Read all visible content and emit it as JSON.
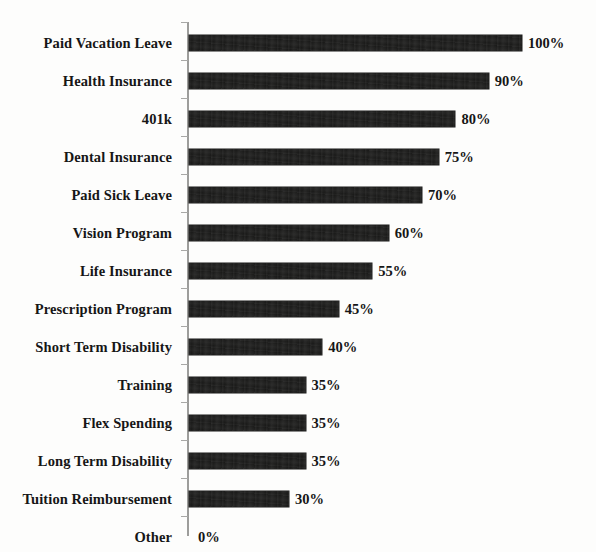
{
  "chart_data": {
    "type": "bar",
    "orientation": "horizontal",
    "title": "",
    "subtitle": "",
    "xlabel": "",
    "ylabel": "",
    "xlim": [
      0,
      100
    ],
    "grid": false,
    "legend": null,
    "value_suffix": "%",
    "categories": [
      "Paid Vacation Leave",
      "Health Insurance",
      "401k",
      "Dental Insurance",
      "Paid Sick Leave",
      "Vision Program",
      "Life Insurance",
      "Prescription Program",
      "Short Term Disability",
      "Training",
      "Flex Spending",
      "Long Term Disability",
      "Tuition Reimbursement",
      "Other"
    ],
    "values": [
      100,
      90,
      80,
      75,
      70,
      60,
      55,
      45,
      40,
      35,
      35,
      35,
      30,
      0
    ],
    "data_labels": [
      "100%",
      "90%",
      "80%",
      "75%",
      "70%",
      "60%",
      "55%",
      "45%",
      "40%",
      "35%",
      "35%",
      "35%",
      "30%",
      "0%"
    ],
    "bar_color": "#1a1a19",
    "axis_color": "#9d9d9b",
    "background_color": "#fdfdfc"
  },
  "rows": [
    {
      "label": "Paid Vacation Leave",
      "value": 100,
      "value_label": "100%"
    },
    {
      "label": "Health Insurance",
      "value": 90,
      "value_label": "90%"
    },
    {
      "label": "401k",
      "value": 80,
      "value_label": "80%"
    },
    {
      "label": "Dental Insurance",
      "value": 75,
      "value_label": "75%"
    },
    {
      "label": "Paid Sick Leave",
      "value": 70,
      "value_label": "70%"
    },
    {
      "label": "Vision Program",
      "value": 60,
      "value_label": "60%"
    },
    {
      "label": "Life Insurance",
      "value": 55,
      "value_label": "55%"
    },
    {
      "label": "Prescription Program",
      "value": 45,
      "value_label": "45%"
    },
    {
      "label": "Short Term Disability",
      "value": 40,
      "value_label": "40%"
    },
    {
      "label": "Training",
      "value": 35,
      "value_label": "35%"
    },
    {
      "label": "Flex Spending",
      "value": 35,
      "value_label": "35%"
    },
    {
      "label": "Long Term Disability",
      "value": 35,
      "value_label": "35%"
    },
    {
      "label": "Tuition Reimbursement",
      "value": 30,
      "value_label": "30%"
    },
    {
      "label": "Other",
      "value": 0,
      "value_label": "0%"
    }
  ]
}
